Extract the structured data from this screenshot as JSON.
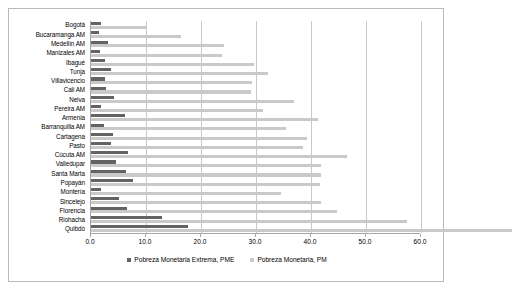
{
  "chart_data": {
    "type": "bar",
    "orientation": "horizontal",
    "title": "",
    "xlabel": "",
    "ylabel": "",
    "xlim": [
      0.0,
      60.0
    ],
    "xticks": [
      "0.0",
      "10.0",
      "20.0",
      "30.0",
      "40.0",
      "50.0",
      "60.0"
    ],
    "xtick_values": [
      0,
      10,
      20,
      30,
      40,
      50,
      60
    ],
    "grid": true,
    "legend_position": "bottom",
    "categories": [
      "Bogotá",
      "Bucaramanga AM",
      "Medellín AM",
      "Manizales AM",
      "Ibagué",
      "Tunja",
      "Villavicencio",
      "Cali AM",
      "Neiva",
      "Pereira AM",
      "Armenia",
      "Barranquilla AM",
      "Cartagena",
      "Pasto",
      "Cúcuta AM",
      "Valledupar",
      "Santa Marta",
      "Popayán",
      "Montería",
      "Sincelejo",
      "Florencia",
      "Riohacha",
      "Quibdó"
    ],
    "series": [
      {
        "name": "Pobreza Monetaria Extrema, PME",
        "key": "pme",
        "color": "#636363",
        "values": [
          1.8,
          1.5,
          3.0,
          1.7,
          2.6,
          3.7,
          2.5,
          2.7,
          4.2,
          1.9,
          6.2,
          2.3,
          4.0,
          3.6,
          6.7,
          4.5,
          6.3,
          7.7,
          1.8,
          5.0,
          6.6,
          12.9,
          17.7
        ]
      },
      {
        "name": "Pobreza Monetaria, PM",
        "key": "pm",
        "color": "#c9c9c9",
        "values": [
          10.2,
          16.3,
          24.1,
          23.9,
          29.7,
          32.2,
          29.3,
          29.1,
          36.9,
          31.3,
          41.2,
          35.5,
          39.3,
          38.6,
          46.5,
          41.8,
          41.9,
          41.7,
          34.5,
          41.8,
          44.8,
          57.4,
          76.5
        ]
      }
    ]
  },
  "legend": {
    "items": [
      {
        "label": "Pobreza Monetaria Extrema, PME",
        "color": "#636363"
      },
      {
        "label": "Pobreza Monetaria, PM",
        "color": "#c9c9c9"
      }
    ]
  }
}
